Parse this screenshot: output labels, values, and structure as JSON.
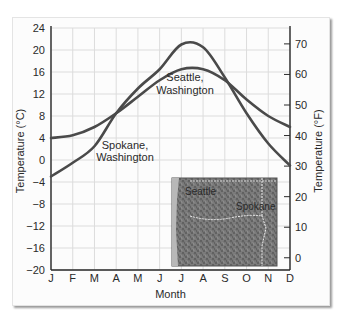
{
  "chart_data": {
    "type": "line",
    "title": "",
    "xlabel": "Month",
    "ylabel": "Temperature (°C)",
    "ylabel_right": "Temperature (°F)",
    "categories": [
      "J",
      "F",
      "M",
      "A",
      "M",
      "J",
      "J",
      "A",
      "S",
      "O",
      "N",
      "D"
    ],
    "ylim": [
      -20,
      24
    ],
    "yticks": [
      24,
      20,
      16,
      12,
      8,
      4,
      0,
      -4,
      -8,
      -12,
      -16,
      -20
    ],
    "yticks_right": [
      70,
      60,
      50,
      40,
      30,
      20,
      10,
      0
    ],
    "grid": true,
    "series": [
      {
        "name": "Seattle, Washington",
        "values": [
          4,
          4.5,
          6,
          8.5,
          11.5,
          14.5,
          16.5,
          16.5,
          14.5,
          11,
          8,
          6
        ]
      },
      {
        "name": "Spokane, Washington",
        "values": [
          -3,
          -0.5,
          2.5,
          8.5,
          13,
          16.5,
          21,
          20.5,
          15,
          8.5,
          3,
          -1
        ]
      }
    ],
    "annotations": [
      {
        "text": [
          "Seattle,",
          "Washington"
        ]
      },
      {
        "text": [
          "Spokane,",
          "Washington"
        ]
      }
    ],
    "inset_map": {
      "labels": [
        "Seattle",
        "Spokane"
      ]
    },
    "line_color": "#4a4a4a"
  }
}
